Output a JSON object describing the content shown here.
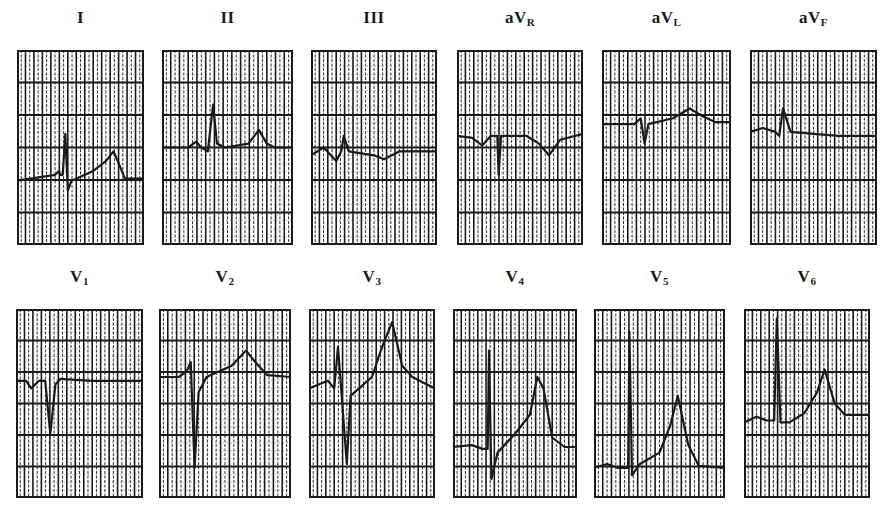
{
  "figure": {
    "type": "12-lead ECG",
    "grid": {
      "major_rows": 6,
      "major_cols": 5,
      "minor_per_major": 3
    },
    "colors": {
      "ink": "#1a1a1a",
      "paper": "#ffffff"
    }
  },
  "leads": [
    {
      "id": "I",
      "label": "I",
      "sub": "",
      "box": [
        17,
        50,
        127,
        195
      ],
      "baseline": 0.67,
      "trace": [
        [
          0,
          0.67
        ],
        [
          0.3,
          0.64
        ],
        [
          0.33,
          0.62
        ],
        [
          0.34,
          0.64
        ],
        [
          0.36,
          0.64
        ],
        [
          0.38,
          0.43
        ],
        [
          0.4,
          0.72
        ],
        [
          0.43,
          0.67
        ],
        [
          0.6,
          0.62
        ],
        [
          0.7,
          0.57
        ],
        [
          0.76,
          0.52
        ],
        [
          0.8,
          0.58
        ],
        [
          0.85,
          0.66
        ],
        [
          1,
          0.66
        ]
      ]
    },
    {
      "id": "II",
      "label": "II",
      "sub": "",
      "box": [
        162,
        50,
        131,
        195
      ],
      "baseline": 0.5,
      "trace": [
        [
          0,
          0.5
        ],
        [
          0.2,
          0.5
        ],
        [
          0.26,
          0.47
        ],
        [
          0.3,
          0.5
        ],
        [
          0.35,
          0.52
        ],
        [
          0.39,
          0.28
        ],
        [
          0.42,
          0.48
        ],
        [
          0.48,
          0.5
        ],
        [
          0.66,
          0.48
        ],
        [
          0.74,
          0.41
        ],
        [
          0.8,
          0.48
        ],
        [
          0.86,
          0.5
        ],
        [
          1,
          0.5
        ]
      ]
    },
    {
      "id": "III",
      "label": "III",
      "sub": "",
      "box": [
        311,
        50,
        126,
        195
      ],
      "baseline": 0.52,
      "trace": [
        [
          0,
          0.54
        ],
        [
          0.1,
          0.5
        ],
        [
          0.2,
          0.57
        ],
        [
          0.24,
          0.52
        ],
        [
          0.26,
          0.44
        ],
        [
          0.3,
          0.52
        ],
        [
          0.5,
          0.54
        ],
        [
          0.58,
          0.56
        ],
        [
          0.7,
          0.52
        ],
        [
          1,
          0.52
        ]
      ]
    },
    {
      "id": "aVR",
      "label": "aV",
      "sub": "R",
      "box": [
        457,
        50,
        126,
        195
      ],
      "baseline": 0.44,
      "trace": [
        [
          0,
          0.44
        ],
        [
          0.12,
          0.45
        ],
        [
          0.2,
          0.49
        ],
        [
          0.27,
          0.44
        ],
        [
          0.32,
          0.44
        ],
        [
          0.33,
          0.64
        ],
        [
          0.35,
          0.44
        ],
        [
          0.55,
          0.44
        ],
        [
          0.65,
          0.48
        ],
        [
          0.73,
          0.54
        ],
        [
          0.82,
          0.46
        ],
        [
          1,
          0.43
        ]
      ]
    },
    {
      "id": "aVL",
      "label": "aV",
      "sub": "L",
      "box": [
        602,
        50,
        129,
        195
      ],
      "baseline": 0.38,
      "trace": [
        [
          0,
          0.38
        ],
        [
          0.25,
          0.38
        ],
        [
          0.3,
          0.35
        ],
        [
          0.33,
          0.48
        ],
        [
          0.36,
          0.38
        ],
        [
          0.55,
          0.35
        ],
        [
          0.68,
          0.3
        ],
        [
          0.78,
          0.34
        ],
        [
          0.88,
          0.37
        ],
        [
          1,
          0.37
        ]
      ]
    },
    {
      "id": "aVF",
      "label": "aV",
      "sub": "F",
      "box": [
        750,
        50,
        127,
        195
      ],
      "baseline": 0.42,
      "trace": [
        [
          0,
          0.42
        ],
        [
          0.1,
          0.4
        ],
        [
          0.2,
          0.42
        ],
        [
          0.23,
          0.44
        ],
        [
          0.26,
          0.3
        ],
        [
          0.32,
          0.42
        ],
        [
          0.5,
          0.43
        ],
        [
          0.7,
          0.44
        ],
        [
          0.85,
          0.44
        ],
        [
          1,
          0.44
        ]
      ]
    },
    {
      "id": "V1",
      "label": "V",
      "sub": "1",
      "box": [
        16,
        309,
        127,
        189
      ],
      "baseline": 0.38,
      "trace": [
        [
          0,
          0.38
        ],
        [
          0.08,
          0.38
        ],
        [
          0.12,
          0.42
        ],
        [
          0.18,
          0.38
        ],
        [
          0.23,
          0.38
        ],
        [
          0.27,
          0.66
        ],
        [
          0.31,
          0.4
        ],
        [
          0.35,
          0.37
        ],
        [
          0.6,
          0.38
        ],
        [
          1,
          0.38
        ]
      ]
    },
    {
      "id": "V2",
      "label": "V",
      "sub": "2",
      "box": [
        159,
        309,
        132,
        189
      ],
      "baseline": 0.36,
      "trace": [
        [
          0,
          0.36
        ],
        [
          0.15,
          0.36
        ],
        [
          0.21,
          0.33
        ],
        [
          0.24,
          0.28
        ],
        [
          0.27,
          0.84
        ],
        [
          0.3,
          0.44
        ],
        [
          0.36,
          0.36
        ],
        [
          0.55,
          0.3
        ],
        [
          0.66,
          0.22
        ],
        [
          0.74,
          0.29
        ],
        [
          0.82,
          0.35
        ],
        [
          1,
          0.36
        ]
      ]
    },
    {
      "id": "V3",
      "label": "V",
      "sub": "3",
      "box": [
        309,
        309,
        126,
        189
      ],
      "baseline": 0.42,
      "trace": [
        [
          0,
          0.42
        ],
        [
          0.15,
          0.38
        ],
        [
          0.2,
          0.42
        ],
        [
          0.23,
          0.2
        ],
        [
          0.3,
          0.82
        ],
        [
          0.33,
          0.46
        ],
        [
          0.5,
          0.36
        ],
        [
          0.58,
          0.2
        ],
        [
          0.66,
          0.07
        ],
        [
          0.74,
          0.3
        ],
        [
          0.82,
          0.36
        ],
        [
          1,
          0.42
        ]
      ]
    },
    {
      "id": "V4",
      "label": "V",
      "sub": "4",
      "box": [
        453,
        309,
        124,
        189
      ],
      "baseline": 0.73,
      "trace": [
        [
          0,
          0.73
        ],
        [
          0.15,
          0.72
        ],
        [
          0.24,
          0.74
        ],
        [
          0.28,
          0.74
        ],
        [
          0.29,
          0.22
        ],
        [
          0.31,
          0.9
        ],
        [
          0.36,
          0.76
        ],
        [
          0.5,
          0.66
        ],
        [
          0.62,
          0.56
        ],
        [
          0.68,
          0.36
        ],
        [
          0.73,
          0.42
        ],
        [
          0.8,
          0.68
        ],
        [
          0.9,
          0.73
        ],
        [
          1,
          0.73
        ]
      ]
    },
    {
      "id": "V5",
      "label": "V",
      "sub": "5",
      "box": [
        594,
        309,
        131,
        189
      ],
      "baseline": 0.84,
      "trace": [
        [
          0,
          0.84
        ],
        [
          0.1,
          0.82
        ],
        [
          0.18,
          0.84
        ],
        [
          0.26,
          0.84
        ],
        [
          0.27,
          0.12
        ],
        [
          0.29,
          0.88
        ],
        [
          0.35,
          0.82
        ],
        [
          0.5,
          0.76
        ],
        [
          0.58,
          0.62
        ],
        [
          0.64,
          0.46
        ],
        [
          0.72,
          0.72
        ],
        [
          0.8,
          0.83
        ],
        [
          1,
          0.84
        ]
      ]
    },
    {
      "id": "V6",
      "label": "V",
      "sub": "6",
      "box": [
        744,
        309,
        126,
        189
      ],
      "baseline": 0.59,
      "trace": [
        [
          0,
          0.6
        ],
        [
          0.1,
          0.57
        ],
        [
          0.18,
          0.59
        ],
        [
          0.24,
          0.59
        ],
        [
          0.26,
          0.05
        ],
        [
          0.29,
          0.6
        ],
        [
          0.36,
          0.6
        ],
        [
          0.48,
          0.55
        ],
        [
          0.58,
          0.44
        ],
        [
          0.64,
          0.32
        ],
        [
          0.72,
          0.5
        ],
        [
          0.8,
          0.56
        ],
        [
          1,
          0.56
        ]
      ]
    }
  ]
}
